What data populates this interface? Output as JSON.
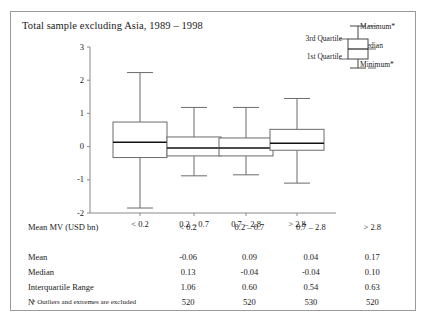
{
  "figure": {
    "title": "Total sample excluding Asia, 1989 – 1998",
    "footnote": "* Outliers and extremes are excluded"
  },
  "legend": {
    "third_quartile": "3rd Quartile",
    "first_quartile": "1st Quartile",
    "maximum": "Maximum*",
    "median": "Median",
    "minimum": "Minimum*"
  },
  "axis": {
    "yticks": [
      "3",
      "2",
      "1",
      "0",
      "-1",
      "-2"
    ]
  },
  "table": {
    "header_label": "Mean MV (USD bn)",
    "categories": [
      "< 0.2",
      "0.2 – 0.7",
      "0.7 – 2.8",
      "> 2.8"
    ],
    "rows": [
      {
        "label": "Mean",
        "values": [
          "-0.06",
          "0.09",
          "0.04",
          "0.17"
        ]
      },
      {
        "label": "Median",
        "values": [
          "0.13",
          "-0.04",
          "-0.04",
          "0.10"
        ]
      },
      {
        "label": "Interquartile Range",
        "values": [
          "1.06",
          "0.60",
          "0.54",
          "0.63"
        ]
      },
      {
        "label": "N",
        "values": [
          "520",
          "520",
          "530",
          "520"
        ]
      }
    ]
  },
  "chart_data": {
    "type": "box",
    "title": "Total sample excluding Asia, 1989 – 1998",
    "xlabel": "Mean MV (USD bn)",
    "ylabel": "",
    "ylim": [
      -2,
      3
    ],
    "yticks": [
      3,
      2,
      1,
      0,
      -1,
      -2
    ],
    "grid": false,
    "legend_position": "top-right",
    "categories": [
      "< 0.2",
      "0.2 – 0.7",
      "0.7 – 2.8",
      "> 2.8"
    ],
    "boxes": [
      {
        "category": "< 0.2",
        "min": -1.85,
        "q1": -0.33,
        "median": 0.13,
        "q3": 0.74,
        "max": 2.23,
        "mean": -0.06,
        "iqr": 1.06,
        "n": 520
      },
      {
        "category": "0.2 – 0.7",
        "min": -0.88,
        "q1": -0.28,
        "median": -0.04,
        "q3": 0.29,
        "max": 1.18,
        "mean": 0.09,
        "iqr": 0.6,
        "n": 520
      },
      {
        "category": "0.7 – 2.8",
        "min": -0.85,
        "q1": -0.28,
        "median": -0.04,
        "q3": 0.26,
        "max": 1.18,
        "mean": 0.04,
        "iqr": 0.54,
        "n": 530
      },
      {
        "category": "> 2.8",
        "min": -1.1,
        "q1": -0.11,
        "median": 0.1,
        "q3": 0.52,
        "max": 1.45,
        "mean": 0.17,
        "iqr": 0.63,
        "n": 520
      }
    ],
    "annotations": [
      "* Outliers and extremes are excluded"
    ]
  }
}
